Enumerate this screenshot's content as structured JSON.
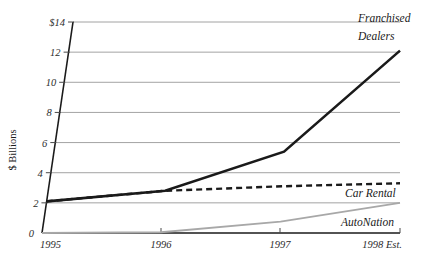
{
  "chart_data": {
    "type": "line",
    "title": "",
    "xlabel": "",
    "ylabel": "$ Billions",
    "x": [
      "1995",
      "1996",
      "1997",
      "1998 Est."
    ],
    "xtick_labels": [
      "1995",
      "1996",
      "1997",
      "1998 Est."
    ],
    "ytick_labels": [
      "0",
      "2",
      "4",
      "6",
      "8",
      "10",
      "12",
      "$14"
    ],
    "ytick_values": [
      0,
      2,
      4,
      6,
      8,
      10,
      12,
      14
    ],
    "ylim": [
      0,
      14
    ],
    "grid": true,
    "legend_position": "inline-right",
    "series": [
      {
        "name": "Franchised Dealers",
        "label": "Franchised",
        "label_line2": "Dealers",
        "values": [
          2.1,
          2.8,
          5.4,
          12.1
        ],
        "style": "solid",
        "color": "#1a1a1a",
        "width": 2.6
      },
      {
        "name": "Car Rental",
        "label": "Car Rental",
        "values": [
          2.1,
          2.8,
          3.1,
          3.3
        ],
        "style": "dashed",
        "color": "#1a1a1a",
        "width": 2.4
      },
      {
        "name": "AutoNation",
        "label": "AutoNation",
        "values": [
          0.0,
          0.05,
          0.75,
          2.0
        ],
        "style": "solid",
        "color": "#a8a8a8",
        "width": 1.8
      }
    ]
  },
  "colors": {
    "franchised_dealers": "#1a1a1a",
    "car_rental": "#1a1a1a",
    "autonation": "#a8a8a8",
    "gridline": "#8c8c8c",
    "axis": "#1a1a1a",
    "background": "#ffffff"
  }
}
